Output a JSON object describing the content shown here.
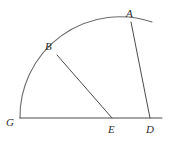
{
  "figure": {
    "width": 169,
    "height": 156,
    "background_color": "#ffffff",
    "stroke_color": "#4a4a4a",
    "arc_stroke_color": "#6b6b6b",
    "label_color": "#2b2b2b",
    "stroke_width": 1,
    "points": [
      {
        "name": "A",
        "label": "A",
        "x": 131,
        "y": 22,
        "label_x": 126,
        "label_y": 8,
        "on": "arc"
      },
      {
        "name": "B",
        "label": "B",
        "x": 57,
        "y": 55,
        "label_x": 45,
        "label_y": 41,
        "on": "arc"
      },
      {
        "name": "G",
        "label": "G",
        "x": 20,
        "y": 118,
        "label_x": 6,
        "label_y": 117,
        "on": "baseline"
      },
      {
        "name": "E",
        "label": "E",
        "x": 112,
        "y": 118,
        "label_x": 108,
        "label_y": 124,
        "on": "baseline"
      },
      {
        "name": "D",
        "label": "D",
        "x": 150,
        "y": 118,
        "label_x": 146,
        "label_y": 124,
        "on": "baseline"
      }
    ],
    "segments": [
      {
        "name": "baseline-G-to-end",
        "from": "G",
        "to": "baseline-end",
        "x1": 20,
        "y1": 118,
        "x2": 162,
        "y2": 118
      },
      {
        "name": "segment-B-E",
        "from": "B",
        "to": "E",
        "x1": 57,
        "y1": 55,
        "x2": 112,
        "y2": 118
      },
      {
        "name": "segment-A-D",
        "from": "A",
        "to": "D",
        "x1": 131,
        "y1": 22,
        "x2": 150,
        "y2": 118
      }
    ],
    "arc": {
      "name": "arc-G-B-A",
      "center_x": 20,
      "center_y": 118,
      "radius": 100,
      "start_x": 20,
      "start_y": 118,
      "end_x": 152,
      "end_y": 22,
      "path": "M 20 118 A 100 100 0 0 1 152 22"
    }
  }
}
